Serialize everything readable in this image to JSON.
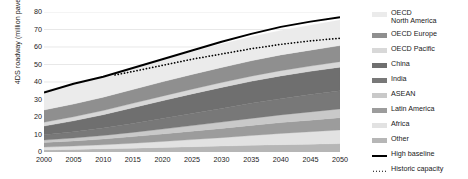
{
  "chart_data": {
    "type": "area",
    "stacked": true,
    "title": "",
    "xlabel": "",
    "ylabel": "4DS roadway (million paved lane-km)",
    "xlim": [
      2000,
      2050
    ],
    "ylim": [
      0,
      80
    ],
    "ytick_step": 10,
    "xtick_step": 5,
    "grid": "horizontal",
    "legend_position": "right",
    "x": [
      2000,
      2005,
      2010,
      2015,
      2020,
      2025,
      2030,
      2035,
      2040,
      2045,
      2050
    ],
    "xtick_labels": [
      "2000",
      "2005",
      "2010",
      "2015",
      "2020",
      "2025",
      "2030",
      "2035",
      "2040",
      "2045",
      "2050"
    ],
    "ytick_labels": [
      "0",
      "10",
      "20",
      "30",
      "40",
      "50",
      "60",
      "70",
      "80"
    ],
    "series": [
      {
        "name": "OECD North America",
        "color": "#ebebeb",
        "values": [
          11.0,
          11.4,
          11.8,
          12.2,
          12.6,
          13.0,
          13.4,
          13.7,
          14.0,
          14.3,
          14.6
        ]
      },
      {
        "name": "OECD Europe",
        "color": "#8f8f8f",
        "values": [
          7.0,
          7.3,
          7.6,
          7.9,
          8.2,
          8.4,
          8.6,
          8.8,
          9.0,
          9.1,
          9.2
        ]
      },
      {
        "name": "OECD Pacific",
        "color": "#d8d8d8",
        "values": [
          2.2,
          2.3,
          2.4,
          2.5,
          2.6,
          2.7,
          2.8,
          2.9,
          3.0,
          3.0,
          3.1
        ]
      },
      {
        "name": "China",
        "color": "#6f6f6f",
        "values": [
          5.0,
          6.2,
          7.6,
          9.0,
          10.2,
          11.2,
          12.0,
          12.6,
          13.0,
          13.3,
          13.5
        ]
      },
      {
        "name": "India",
        "color": "#787878",
        "values": [
          3.0,
          3.6,
          4.3,
          5.1,
          6.0,
          6.9,
          7.8,
          8.6,
          9.3,
          9.9,
          10.4
        ]
      },
      {
        "name": "ASEAN",
        "color": "#c9c9c9",
        "values": [
          1.4,
          1.7,
          2.0,
          2.4,
          2.8,
          3.2,
          3.6,
          4.0,
          4.4,
          4.7,
          5.0
        ]
      },
      {
        "name": "Latin America",
        "color": "#9c9c9c",
        "values": [
          2.6,
          2.9,
          3.3,
          3.8,
          4.3,
          4.8,
          5.3,
          5.8,
          6.2,
          6.6,
          7.0
        ]
      },
      {
        "name": "Africa",
        "color": "#e2e2e2",
        "values": [
          1.6,
          1.9,
          2.3,
          2.8,
          3.4,
          4.1,
          4.8,
          5.6,
          6.4,
          7.1,
          7.8
        ]
      },
      {
        "name": "Other",
        "color": "#b6b6b6",
        "values": [
          1.2,
          1.5,
          1.8,
          2.2,
          2.6,
          3.0,
          3.4,
          3.8,
          4.2,
          4.5,
          4.8
        ]
      }
    ],
    "lines": [
      {
        "name": "High baseline",
        "style": "solid",
        "color": "#000000",
        "x": [
          2000,
          2005,
          2010,
          2015,
          2020,
          2025,
          2030,
          2035,
          2040,
          2045,
          2050
        ],
        "values": [
          34.0,
          39.0,
          43.0,
          48.0,
          53.0,
          58.0,
          63.0,
          67.5,
          71.5,
          74.5,
          77.0
        ]
      },
      {
        "name": "Historic capacity",
        "style": "dotted",
        "color": "#000000",
        "x": [
          2012,
          2015,
          2020,
          2025,
          2030,
          2035,
          2040,
          2045,
          2050
        ],
        "values": [
          44.0,
          46.0,
          49.5,
          53.0,
          56.0,
          59.0,
          61.5,
          63.5,
          65.0
        ]
      }
    ]
  },
  "legend": {
    "items": [
      {
        "label": "OECD\nNorth America",
        "swatch": "#ebebeb",
        "type": "area"
      },
      {
        "label": "OECD Europe",
        "swatch": "#8f8f8f",
        "type": "area"
      },
      {
        "label": "OECD Pacific",
        "swatch": "#d8d8d8",
        "type": "area"
      },
      {
        "label": "China",
        "swatch": "#6f6f6f",
        "type": "area"
      },
      {
        "label": "India",
        "swatch": "#787878",
        "type": "area"
      },
      {
        "label": "ASEAN",
        "swatch": "#c9c9c9",
        "type": "area"
      },
      {
        "label": "Latin America",
        "swatch": "#9c9c9c",
        "type": "area"
      },
      {
        "label": "Africa",
        "swatch": "#e2e2e2",
        "type": "area"
      },
      {
        "label": "Other",
        "swatch": "#b6b6b6",
        "type": "area"
      },
      {
        "label": "High baseline",
        "swatch": "#000000",
        "type": "line"
      },
      {
        "label": "Historic capacity",
        "swatch": "#000000",
        "type": "dotline"
      }
    ]
  },
  "colors": {
    "grid": "#d9d9d9",
    "axis": "#6e6e6e",
    "text": "#1a1a1a",
    "background": "#ffffff"
  }
}
